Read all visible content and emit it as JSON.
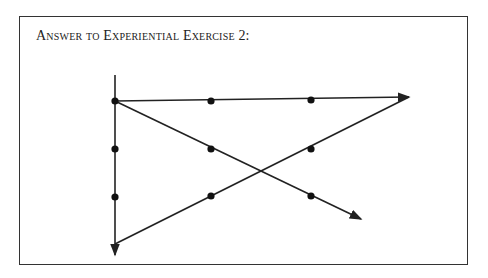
{
  "title": "Answer to Experiential Exercise 2:",
  "diagram": {
    "dots": [
      {
        "x": 115,
        "y": 101
      },
      {
        "x": 211,
        "y": 101
      },
      {
        "x": 311,
        "y": 100
      },
      {
        "x": 115,
        "y": 149
      },
      {
        "x": 211,
        "y": 149
      },
      {
        "x": 311,
        "y": 149
      },
      {
        "x": 115,
        "y": 197
      },
      {
        "x": 211,
        "y": 196
      },
      {
        "x": 311,
        "y": 196
      }
    ],
    "lines": [
      {
        "from": [
          115,
          75
        ],
        "to": [
          115,
          255
        ],
        "arrow": "end"
      },
      {
        "from": [
          115,
          101
        ],
        "to": [
          409,
          97
        ],
        "arrow": "end"
      },
      {
        "from": [
          115,
          101
        ],
        "to": [
          361,
          219
        ],
        "arrow": "end"
      },
      {
        "from": [
          115,
          244
        ],
        "to": [
          409,
          97
        ],
        "arrow": "none"
      }
    ],
    "line_color": "#222222",
    "dot_color": "#111111"
  }
}
